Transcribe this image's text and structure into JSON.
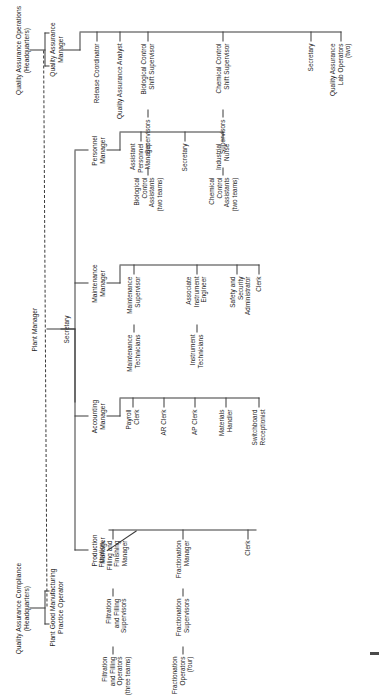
{
  "chart": {
    "orientation": "rotated-90-ccw",
    "line_color": "#3a3a3a",
    "text_color": "#222222",
    "background": "#ffffff"
  },
  "headquarters": {
    "qa_operations": "Quality Assurance Operations\n(Headquarters)",
    "qa_compliance": "Quality Assurance Compliance\n(Headquarters)"
  },
  "top": {
    "plant_manager": "Plant Manager",
    "secretary": "Secretary",
    "qa_manager": "Quality Assurance\nManager",
    "gmp_operator": "Plant Good Manufacturing\nPractice Operator"
  },
  "production": {
    "head": "Production\nManager",
    "clerk": "Clerk",
    "fractionation": {
      "manager": "Fractionation\nManager",
      "supervisors": "Fractionation\nSupervisors",
      "operators": "Fractionation\nOperators\n(four)"
    },
    "filtration": {
      "manager": "Filtration,\nFilling and\nFinishing\nManager",
      "supervisors": "Filtration\nand Filling\nSupervisors",
      "operators": "Filtration\nand Filling\nOperators\n(three teams)"
    }
  },
  "accounting": {
    "head": "Accounting\nManager",
    "reports": [
      "Payroll\nClerk",
      "AR Clerk",
      "AP Clerk",
      "Materials\nHandler",
      "Switchboard\nReceptionist"
    ]
  },
  "maintenance": {
    "head": "Maintenance\nManager",
    "supervisor": "Maintenance\nSupervisor",
    "technicians": "Maintenance\nTechnicians",
    "instrument_engineer": "Associate\nInstrument\nEngineer",
    "instrument_technicians": "Instrument\nTechnicians",
    "safety": "Safety and\nSecurity\nAdministrator",
    "clerk": "Clerk"
  },
  "personnel": {
    "head": "Personnel\nManager",
    "reports": [
      "Assistant\nPersonnel\nManager",
      "Secretary",
      "Industrial\nNurse"
    ]
  },
  "quality_assurance": {
    "head": "Quality Assurance\nManager",
    "release_coordinator": "Release Coordinator",
    "analyst": "Quality Assurance Analyst",
    "biological": {
      "shift_supervisor": "Biological Control\nShift Supervisor",
      "supervisors": "Supervisors",
      "assistants": "Biological\nControl\nAssistants\n(two teams)"
    },
    "chemical": {
      "shift_supervisor": "Chemical Control\nShift Supervisor",
      "supervisors": "Supervisors",
      "assistants": "Chemical\nControl\nAssistants\n(two teams)"
    },
    "secretary": "Secretary",
    "lab_operators": "Quality Assurance\nLab Operators\n(two)"
  }
}
